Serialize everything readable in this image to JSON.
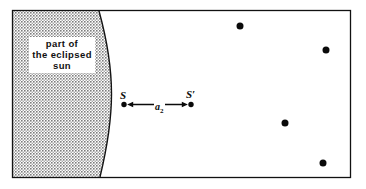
{
  "figure": {
    "background_color": "#ffffff",
    "frame": {
      "stroke_color": "#111111",
      "x": 12,
      "y": 10,
      "width": 339,
      "height": 168
    },
    "shaded_region": {
      "name": "eclipsed-sun-disc",
      "fill_pattern": "stipple-dots",
      "fill_color": "#9a9a9a",
      "edge_color": "#111111",
      "label_lines": [
        "part of",
        "the eclipsed",
        "sun"
      ],
      "arc": {
        "top_x": 99,
        "mid_x": 111,
        "bottom_x": 100
      }
    },
    "measurement": {
      "name": "separation-a2",
      "label": "a",
      "subscript": "2",
      "from_point": "S",
      "to_point": "S'",
      "arrow_color": "#0a0a0a"
    },
    "points": [
      {
        "name": "point-S",
        "label": "S",
        "x": 124,
        "y": 104,
        "r": 2.6,
        "color": "#0a0a0a"
      },
      {
        "name": "point-S-prime",
        "label": "S′",
        "x": 191,
        "y": 104,
        "r": 2.6,
        "color": "#0a0a0a"
      },
      {
        "name": "star-1",
        "label": "",
        "x": 240,
        "y": 26,
        "r": 3.4,
        "color": "#0a0a0a"
      },
      {
        "name": "star-2",
        "label": "",
        "x": 326,
        "y": 50,
        "r": 3.4,
        "color": "#0a0a0a"
      },
      {
        "name": "star-3",
        "label": "",
        "x": 285,
        "y": 123,
        "r": 3.4,
        "color": "#0a0a0a"
      },
      {
        "name": "star-4",
        "label": "",
        "x": 323,
        "y": 163,
        "r": 3.4,
        "color": "#0a0a0a"
      }
    ]
  }
}
